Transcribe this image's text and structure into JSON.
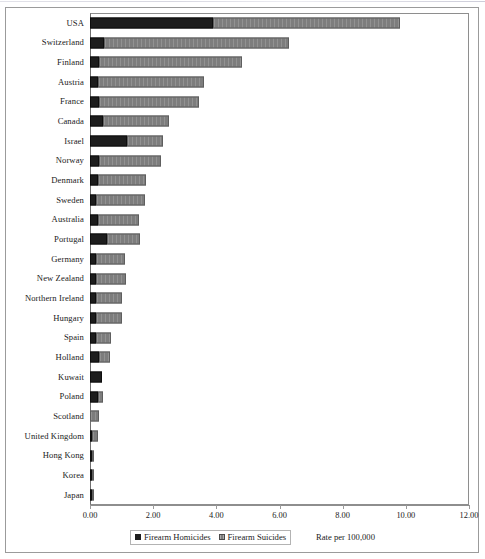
{
  "chart_data": {
    "type": "bar",
    "orientation": "horizontal",
    "stacked": true,
    "title": "",
    "xlabel": "Rate per 100,000",
    "ylabel": "",
    "xlim": [
      0,
      12
    ],
    "xticks": [
      "0.00",
      "2.00",
      "4.00",
      "6.00",
      "8.00",
      "10.00",
      "12.00"
    ],
    "xtick_values": [
      0,
      2,
      4,
      6,
      8,
      10,
      12
    ],
    "grid": false,
    "legend_position": "bottom",
    "categories": [
      "USA",
      "Switzerland",
      "Finland",
      "Austria",
      "France",
      "Canada",
      "Israel",
      "Norway",
      "Denmark",
      "Sweden",
      "Australia",
      "Portugal",
      "Germany",
      "New Zealand",
      "Northern Ireland",
      "Hungary",
      "Spain",
      "Holland",
      "Kuwait",
      "Poland",
      "Scotland",
      "United Kingdom",
      "Hong Kong",
      "Korea",
      "Japan"
    ],
    "series": [
      {
        "name": "Firearm Homicides",
        "color": "#1d1d1d",
        "values": [
          3.9,
          0.45,
          0.3,
          0.25,
          0.28,
          0.4,
          1.17,
          0.3,
          0.25,
          0.2,
          0.25,
          0.55,
          0.2,
          0.2,
          0.2,
          0.2,
          0.2,
          0.3,
          0.37,
          0.25,
          0.0,
          0.07,
          0.07,
          0.06,
          0.05
        ]
      },
      {
        "name": "Firearm Suicides",
        "color": "#7d7d7d",
        "values": [
          5.9,
          5.85,
          4.5,
          3.35,
          3.17,
          2.1,
          1.13,
          1.95,
          1.53,
          1.55,
          1.3,
          1.03,
          0.9,
          0.95,
          0.8,
          0.8,
          0.47,
          0.33,
          0.0,
          0.15,
          0.28,
          0.18,
          0.05,
          0.04,
          0.03
        ]
      }
    ],
    "totals": [
      9.8,
      6.3,
      4.8,
      3.6,
      3.45,
      2.5,
      2.3,
      2.25,
      1.78,
      1.75,
      1.55,
      1.58,
      1.1,
      1.15,
      1.0,
      1.0,
      0.67,
      0.63,
      0.37,
      0.4,
      0.28,
      0.25,
      0.12,
      0.1,
      0.08
    ]
  },
  "legend": {
    "items": [
      {
        "label": "Firearm Homicides",
        "swatch": "homicide"
      },
      {
        "label": "Firearm Suicides",
        "swatch": "suicide"
      }
    ]
  },
  "axis": {
    "title": "Rate per 100,000"
  }
}
